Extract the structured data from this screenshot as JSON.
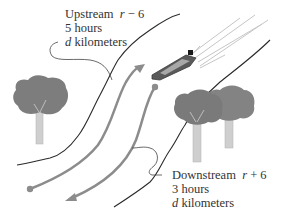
{
  "upstream": {
    "title": "Upstream",
    "rate_var": "r",
    "rate_op": "− 6",
    "time": "5 hours",
    "dist_var": "d",
    "dist_unit": "kilometers"
  },
  "downstream": {
    "title": "Downstream",
    "rate_var": "r",
    "rate_op": "+ 6",
    "time": "3 hours",
    "dist_var": "d",
    "dist_unit": "kilometers"
  },
  "colors": {
    "bank_line": "#2a2a2a",
    "arrow": "#8c8c8c",
    "tree_foliage": "#7d7d7d",
    "tree_trunk": "#c8c8c8",
    "text": "#333333"
  }
}
